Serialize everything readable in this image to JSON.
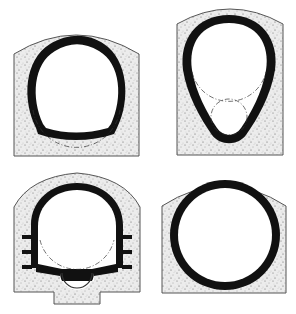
{
  "diagram": {
    "type": "tunnel-cross-sections",
    "panel_count": 4,
    "colors": {
      "background": "#ffffff",
      "concrete_fill": "#eaeaea",
      "concrete_speckle": "#555555",
      "outline": "#444444",
      "lining": "#111111",
      "construction_line": "#333333"
    },
    "panels": [
      {
        "id": "top-left",
        "shape": "circular lining with flattened invert"
      },
      {
        "id": "top-right",
        "shape": "egg-shaped (ovoid) lining"
      },
      {
        "id": "bottom-left",
        "shape": "horseshoe lining with side flanges and invert drain channel"
      },
      {
        "id": "bottom-right",
        "shape": "full circular lining"
      }
    ]
  }
}
